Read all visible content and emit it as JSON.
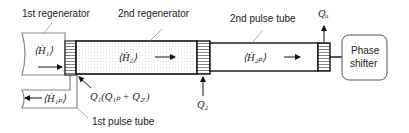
{
  "labels": {
    "first_regenerator": "1st regenerator",
    "second_regenerator": "2nd regenerator",
    "second_pulse_tube": "2nd pulse tube",
    "first_pulse_tube": "1st pulse tube",
    "phase_shifter_line1": "Phase",
    "phase_shifter_line2": "shifter"
  },
  "symbols": {
    "H1": "⟨Ḣ₁⟩",
    "H2": "⟨Ḣ₂⟩",
    "H2p": "⟨Ḣ₂ₚ⟩",
    "H1p": "⟨Ḣ₁ₚ⟩",
    "Q1": "Q₁(Q₁ₚ + Q₂ᵣ)",
    "Q2": "Q₂",
    "Qa": "Qₐ"
  }
}
